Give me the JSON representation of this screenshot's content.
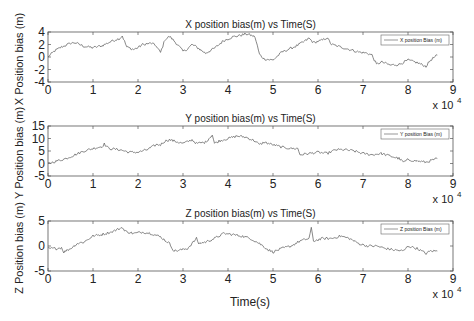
{
  "chart_data": [
    {
      "type": "line",
      "title": "X position bias(m) vs Time(S)",
      "xlabel": "",
      "ylabel": "X Position bias (m)",
      "xlim": [
        0,
        90000
      ],
      "ylim": [
        -4,
        4
      ],
      "x_ticks": [
        0,
        1,
        2,
        3,
        4,
        5,
        6,
        7,
        8,
        9
      ],
      "x_tick_labels": [
        "0",
        "1",
        "2",
        "3",
        "4",
        "5",
        "6",
        "7",
        "8",
        "9"
      ],
      "x_multiplier": "x 10^4",
      "y_ticks": [
        -4,
        -2,
        0,
        2,
        4
      ],
      "y_tick_labels": [
        "-4",
        "-2",
        "0",
        "2",
        "4"
      ],
      "grid": false,
      "legend": {
        "position": "upper right",
        "entries": [
          "X position Bias (m)"
        ]
      },
      "series": [
        {
          "name": "X position Bias (m)",
          "x": [
            0,
            1500,
            3000,
            5000,
            6000,
            8000,
            10000,
            12000,
            14000,
            16000,
            16500,
            17500,
            19000,
            20000,
            21000,
            23000,
            24000,
            25000,
            26000,
            27000,
            28000,
            29000,
            30000,
            31000,
            32000,
            33000,
            35000,
            37000,
            39000,
            41000,
            43000,
            44000,
            45000,
            46000,
            47000,
            48000,
            50000,
            52000,
            54000,
            55000,
            57000,
            58000,
            59000,
            61000,
            62000,
            63000,
            65000,
            67000,
            69000,
            71000,
            72000,
            73000,
            74000,
            75000,
            76000,
            78000,
            80000,
            82000,
            84000,
            85000,
            86500
          ],
          "y": [
            0,
            1.0,
            1.6,
            2.2,
            2.3,
            1.7,
            1.5,
            1.8,
            2.5,
            3.0,
            3.4,
            1.6,
            1.2,
            1.5,
            2.0,
            2.2,
            1.8,
            0.7,
            2.8,
            3.3,
            2.6,
            1.8,
            0.9,
            1.3,
            2.0,
            1.6,
            0.6,
            1.4,
            2.6,
            3.2,
            3.5,
            3.7,
            3.5,
            3.2,
            0.4,
            -0.3,
            -0.5,
            0.8,
            1.4,
            1.7,
            2.5,
            3.0,
            2.3,
            2.7,
            3.1,
            2.0,
            1.6,
            1.2,
            0.8,
            0.6,
            0.3,
            -1.2,
            -0.8,
            -1.0,
            -1.3,
            -1.2,
            -0.5,
            -0.9,
            -1.5,
            -0.5,
            0.3
          ]
        }
      ]
    },
    {
      "type": "line",
      "title": "Y position bias(m) vs Time(S)",
      "xlabel": "",
      "ylabel": "Y Position bias (m)",
      "xlim": [
        0,
        90000
      ],
      "ylim": [
        -5,
        15
      ],
      "x_ticks": [
        0,
        1,
        2,
        3,
        4,
        5,
        6,
        7,
        8,
        9
      ],
      "x_tick_labels": [
        "0",
        "1",
        "2",
        "3",
        "4",
        "5",
        "6",
        "7",
        "8",
        "9"
      ],
      "x_multiplier": "x 10^4",
      "y_ticks": [
        -5,
        0,
        5,
        10,
        15
      ],
      "y_tick_labels": [
        "-5",
        "0",
        "5",
        "10",
        "15"
      ],
      "grid": false,
      "legend": {
        "position": "upper right",
        "entries": [
          "Y position Bias (m)"
        ]
      },
      "series": [
        {
          "name": "Y position Bias (m)",
          "x": [
            0,
            2000,
            4000,
            6000,
            8000,
            10000,
            12000,
            12500,
            13500,
            16000,
            18000,
            20000,
            22000,
            24000,
            25000,
            26000,
            27000,
            28000,
            30000,
            32000,
            33000,
            35000,
            36500,
            37000,
            38000,
            40000,
            42000,
            44000,
            46000,
            47000,
            48000,
            50000,
            52000,
            54000,
            55500,
            56000,
            58000,
            60000,
            62000,
            64000,
            66000,
            68000,
            70000,
            72000,
            74000,
            76000,
            78000,
            79000,
            80000,
            82000,
            84000,
            86500
          ],
          "y": [
            0,
            1.0,
            2.0,
            3.5,
            5.0,
            6.0,
            6.8,
            7.8,
            6.0,
            5.5,
            4.5,
            4.5,
            5.5,
            7.5,
            7.5,
            9.0,
            9.5,
            9.0,
            8.0,
            9.5,
            8.0,
            8.5,
            11.5,
            8.0,
            9.0,
            10.0,
            11.0,
            10.5,
            9.0,
            7.5,
            8.5,
            7.5,
            6.5,
            6.0,
            6.0,
            3.5,
            4.0,
            4.5,
            4.0,
            5.5,
            5.5,
            5.0,
            4.0,
            3.5,
            4.0,
            3.0,
            2.0,
            0.5,
            1.5,
            1.0,
            0.5,
            2.0
          ]
        }
      ]
    },
    {
      "type": "line",
      "title": "Z position bias(m) vs Time(S)",
      "xlabel": "Time(s)",
      "ylabel": "Z Position bias (m)",
      "xlim": [
        0,
        90000
      ],
      "ylim": [
        -5,
        5
      ],
      "x_ticks": [
        0,
        1,
        2,
        3,
        4,
        5,
        6,
        7,
        8,
        9
      ],
      "x_tick_labels": [
        "0",
        "1",
        "2",
        "3",
        "4",
        "5",
        "6",
        "7",
        "8",
        "9"
      ],
      "x_multiplier": "x 10^4",
      "y_ticks": [
        -5,
        0,
        5
      ],
      "y_tick_labels": [
        "-5",
        "0",
        "5"
      ],
      "grid": false,
      "legend": {
        "position": "upper right",
        "entries": [
          "Z position Bias (m)"
        ]
      },
      "series": [
        {
          "name": "Z position Bias (m)",
          "x": [
            0,
            2000,
            3000,
            3500,
            5000,
            6500,
            8000,
            10000,
            12000,
            14000,
            16000,
            16500,
            17000,
            19000,
            21000,
            23000,
            25000,
            27000,
            28000,
            29500,
            31000,
            32000,
            33000,
            33500,
            35000,
            37000,
            39000,
            41000,
            43000,
            45000,
            47000,
            49000,
            50000,
            52000,
            54000,
            56000,
            58000,
            58500,
            59000,
            61000,
            63000,
            65000,
            67000,
            69000,
            71000,
            73000,
            75000,
            77000,
            79000,
            80000,
            82000,
            84000,
            85000,
            86500
          ],
          "y": [
            -0.5,
            -0.5,
            -0.3,
            -1.2,
            -0.5,
            0.5,
            0.8,
            2.0,
            2.3,
            2.8,
            3.5,
            3.8,
            3.0,
            2.5,
            2.8,
            2.5,
            1.8,
            0.5,
            -1.0,
            -0.8,
            -0.5,
            0.5,
            1.5,
            0.5,
            0.8,
            1.5,
            2.5,
            2.3,
            2.0,
            1.5,
            0.5,
            -0.8,
            -1.2,
            -0.5,
            0.0,
            1.0,
            1.5,
            3.5,
            1.0,
            1.5,
            1.5,
            2.0,
            1.5,
            0.5,
            0.0,
            0.0,
            -0.5,
            -0.8,
            -1.0,
            0.0,
            -0.5,
            -1.5,
            -1.0,
            -1.0
          ]
        }
      ]
    }
  ]
}
